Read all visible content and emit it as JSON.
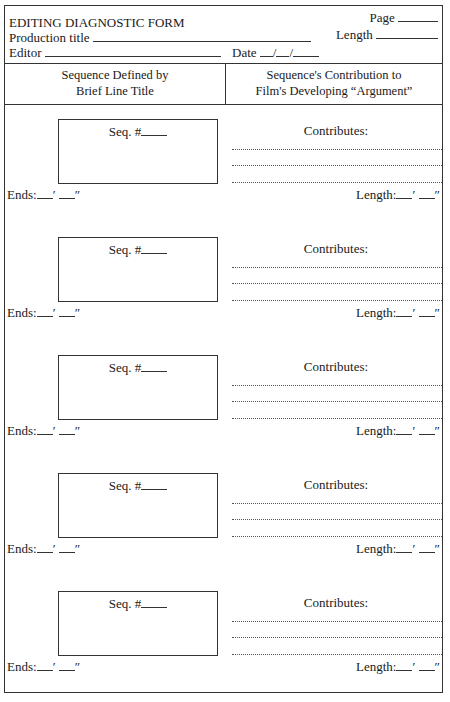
{
  "header": {
    "form_title": "EDITING DIAGNOSTIC FORM",
    "page_label": "Page",
    "production_title_label": "Production title",
    "length_label": "Length",
    "editor_label": "Editor",
    "date_label": "Date",
    "date_separator": "/"
  },
  "columns": {
    "left_line1": "Sequence Defined by",
    "left_line2": "Brief Line Title",
    "right_line1": "Sequence's Contribution to",
    "right_line2": "Film's Developing “Argument”"
  },
  "sequences": [
    {
      "seq_label": "Seq. #",
      "contributes_label": "Contributes:",
      "ends_label": "Ends:",
      "length_label": "Length:",
      "feet_mark": "′",
      "inch_mark": "″"
    },
    {
      "seq_label": "Seq. #",
      "contributes_label": "Contributes:",
      "ends_label": "Ends:",
      "length_label": "Length:",
      "feet_mark": "′",
      "inch_mark": "″"
    },
    {
      "seq_label": "Seq. #",
      "contributes_label": "Contributes:",
      "ends_label": "Ends:",
      "length_label": "Length:",
      "feet_mark": "′",
      "inch_mark": "″"
    },
    {
      "seq_label": "Seq. #",
      "contributes_label": "Contributes:",
      "ends_label": "Ends:",
      "length_label": "Length:",
      "feet_mark": "′",
      "inch_mark": "″"
    },
    {
      "seq_label": "Seq. #",
      "contributes_label": "Contributes:",
      "ends_label": "Ends:",
      "length_label": "Length:",
      "feet_mark": "′",
      "inch_mark": "″"
    }
  ]
}
